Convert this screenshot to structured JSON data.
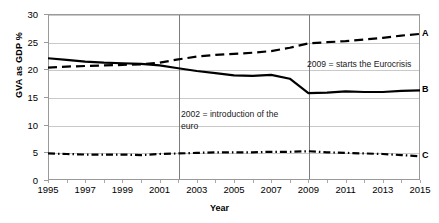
{
  "chart_data": {
    "type": "line",
    "title": "",
    "xlabel": "Year",
    "ylabel": "GVA as GDP %",
    "xlim": [
      1995,
      2015
    ],
    "ylim": [
      0,
      30
    ],
    "ytick_labels": [
      "0",
      "5",
      "10",
      "15",
      "20",
      "25",
      "30"
    ],
    "ytick_values": [
      0,
      5,
      10,
      15,
      20,
      25,
      30
    ],
    "xtick_labels": [
      "1995",
      "1997",
      "1999",
      "2001",
      "2003",
      "2005",
      "2007",
      "2009",
      "2011",
      "2013",
      "2015"
    ],
    "xtick_values": [
      1995,
      1997,
      1999,
      2001,
      2003,
      2005,
      2007,
      2009,
      2011,
      2013,
      2015
    ],
    "grid": true,
    "legend": "inline-right-end-labels",
    "x": [
      1995,
      1996,
      1997,
      1998,
      1999,
      2000,
      2001,
      2002,
      2003,
      2004,
      2005,
      2006,
      2007,
      2008,
      2009,
      2010,
      2011,
      2012,
      2013,
      2014,
      2015
    ],
    "series": [
      {
        "name": "A",
        "style": "dashed",
        "color": "#000000",
        "end_label": "A",
        "values": [
          20.3,
          20.5,
          20.6,
          20.7,
          20.8,
          20.9,
          21.2,
          21.8,
          22.3,
          22.6,
          22.8,
          23.0,
          23.3,
          23.9,
          24.7,
          24.9,
          25.1,
          25.4,
          25.7,
          26.1,
          26.4
        ]
      },
      {
        "name": "B",
        "style": "solid",
        "color": "#000000",
        "end_label": "B",
        "values": [
          22.0,
          21.7,
          21.4,
          21.2,
          21.1,
          21.0,
          20.7,
          20.2,
          19.7,
          19.3,
          18.9,
          18.8,
          19.0,
          18.3,
          15.7,
          15.8,
          16.0,
          15.9,
          15.9,
          16.1,
          16.2
        ]
      },
      {
        "name": "C",
        "style": "dashdot",
        "color": "#000000",
        "end_label": "C",
        "values": [
          4.8,
          4.7,
          4.6,
          4.6,
          4.6,
          4.5,
          4.7,
          4.8,
          4.9,
          5.0,
          5.0,
          5.0,
          5.1,
          5.1,
          5.2,
          5.0,
          4.9,
          4.8,
          4.7,
          4.5,
          4.3
        ]
      }
    ],
    "annotations": [
      {
        "name": "euro-introduction",
        "x": 2002,
        "text": "2002 = introduction of the\neuro",
        "vline": true
      },
      {
        "name": "eurocrisis-start",
        "x": 2009,
        "text": "2009 = starts the Eurocrisis",
        "vline": true
      }
    ]
  }
}
